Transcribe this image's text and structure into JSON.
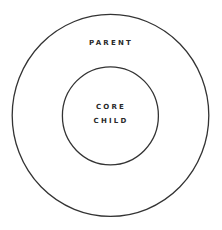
{
  "diagram": {
    "type": "nested-circles",
    "stroke_color": "#333333",
    "background": "#ffffff",
    "outer": {
      "label": "PARENT"
    },
    "inner": {
      "label_line1": "CORE",
      "label_line2": "CHILD"
    }
  }
}
